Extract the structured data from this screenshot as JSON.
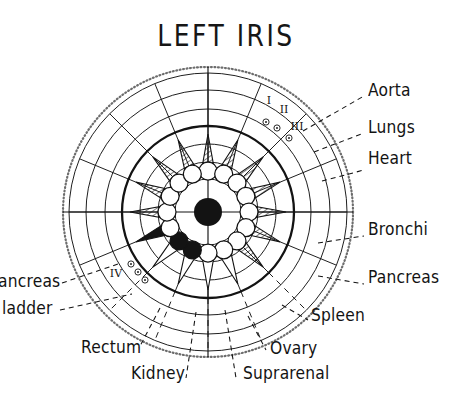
{
  "page": {
    "title": "LEFT IRIS",
    "background": "#ffffff",
    "ink": "#131313",
    "width": 452,
    "height": 419
  },
  "diagram": {
    "name": "iris-chart",
    "center": {
      "x": 208,
      "y": 212
    },
    "pupil_radius": 14,
    "outer_radius": 145,
    "rings": [
      {
        "r": 145,
        "style": "stippled",
        "label": "outer-stippled-ring"
      },
      {
        "r": 139,
        "style": "thin",
        "label": "ring-outer-2"
      },
      {
        "r": 122,
        "style": "thin",
        "label": "ring-outer-3"
      },
      {
        "r": 103,
        "style": "thin",
        "label": "ring-outer-4"
      },
      {
        "r": 86,
        "style": "bold",
        "label": "ring-bold-collarette-outer"
      },
      {
        "r": 68,
        "style": "thin",
        "label": "ring-inner-1"
      },
      {
        "r": 50,
        "style": "thin",
        "label": "ring-inner-2"
      },
      {
        "r": 33,
        "style": "thin",
        "label": "ring-inner-3"
      }
    ],
    "collarette": {
      "circle_count": 16,
      "circle_radius": 9,
      "orbit_radius": 41,
      "solid_indices": [
        9,
        10
      ]
    },
    "spikes": {
      "count": 16,
      "hatched_range": "upper",
      "solid_indices": [
        11
      ],
      "outline_indices": [
        8,
        9,
        10
      ]
    },
    "axes": {
      "horizontal": true,
      "vertical": true
    }
  },
  "markers": [
    {
      "numeral": "I",
      "x": 269,
      "y": 104,
      "dots": [
        {
          "x": 266,
          "y": 122
        }
      ]
    },
    {
      "numeral": "II",
      "x": 284,
      "y": 113,
      "dots": [
        {
          "x": 277,
          "y": 128
        }
      ]
    },
    {
      "numeral": "III",
      "x": 297,
      "y": 130,
      "dots": [
        {
          "x": 289,
          "y": 138
        }
      ]
    },
    {
      "numeral": "IV",
      "x": 116,
      "y": 277,
      "dots": [
        {
          "x": 131,
          "y": 264
        },
        {
          "x": 138,
          "y": 272
        },
        {
          "x": 145,
          "y": 280
        }
      ]
    }
  ],
  "labels": {
    "right": [
      {
        "text": "Aorta",
        "x": 368,
        "y": 87,
        "leader_from": {
          "x": 303,
          "y": 131
        },
        "leader_to": {
          "x": 364,
          "y": 96
        }
      },
      {
        "text": "Lungs",
        "x": 368,
        "y": 124,
        "leader_from": {
          "x": 314,
          "y": 152
        },
        "leader_to": {
          "x": 364,
          "y": 133
        }
      },
      {
        "text": "Heart",
        "x": 368,
        "y": 155,
        "leader_from": {
          "x": 322,
          "y": 181
        },
        "leader_to": {
          "x": 364,
          "y": 170
        }
      },
      {
        "text": "Bronchi",
        "x": 368,
        "y": 226,
        "leader_from": {
          "x": 318,
          "y": 243
        },
        "leader_to": {
          "x": 364,
          "y": 236
        }
      },
      {
        "text": "Pancreas",
        "x": 368,
        "y": 274,
        "leader_from": {
          "x": 318,
          "y": 276
        },
        "leader_to": {
          "x": 364,
          "y": 284
        }
      },
      {
        "text": "Spleen",
        "x": 311,
        "y": 312,
        "leader_from": {
          "x": 282,
          "y": 305
        },
        "leader_to": {
          "x": 308,
          "y": 320
        }
      }
    ],
    "bottom": [
      {
        "text": "Ovary",
        "x": 270,
        "y": 345,
        "leader_from": {
          "x": 248,
          "y": 316
        },
        "leader_to": {
          "x": 266,
          "y": 350
        }
      },
      {
        "text": "Suprarenal",
        "x": 243,
        "y": 370,
        "leader_from": {
          "x": 225,
          "y": 310
        },
        "leader_to": {
          "x": 236,
          "y": 378
        }
      },
      {
        "text": "Kidney",
        "x": 131,
        "y": 370,
        "leader_from": {
          "x": 196,
          "y": 312
        },
        "leader_to": {
          "x": 186,
          "y": 378
        }
      },
      {
        "text": "Rectum",
        "x": 81,
        "y": 344,
        "leader_from": {
          "x": 160,
          "y": 308
        },
        "leader_to": {
          "x": 139,
          "y": 348
        }
      }
    ],
    "left": [
      {
        "text": "Pancreas",
        "visible_text": "ancreas",
        "x": -10,
        "y": 278,
        "clipped": true,
        "leader_from": {
          "x": 62,
          "y": 283
        },
        "leader_to": {
          "x": 118,
          "y": 264
        }
      },
      {
        "text": "Bladder",
        "visible_text": "ladder",
        "x": -4,
        "y": 305,
        "clipped": true,
        "leader_from": {
          "x": 60,
          "y": 310
        },
        "leader_to": {
          "x": 132,
          "y": 294
        }
      }
    ]
  }
}
